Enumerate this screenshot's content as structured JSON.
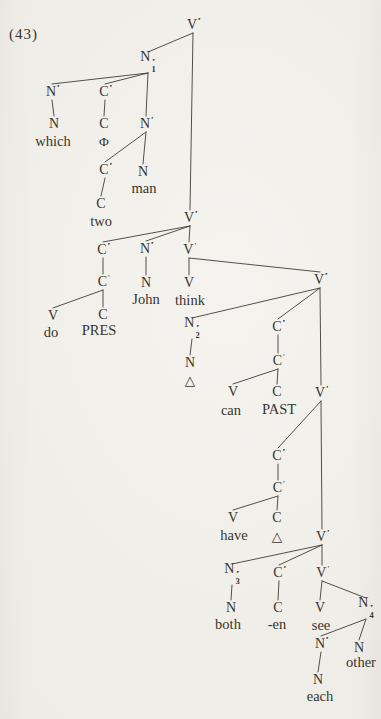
{
  "figure": {
    "label": "(43)"
  },
  "colors": {
    "background": "#f1efe9",
    "ink": "#38342d",
    "line": "#413d36"
  },
  "diagram": {
    "width": 381,
    "height": 719,
    "nodes": [
      {
        "id": "r",
        "base": "V",
        "primes": 3,
        "sub": "",
        "x": 193,
        "y": 25
      },
      {
        "id": "n1",
        "base": "N",
        "primes": 3,
        "sub": "1",
        "x": 148,
        "y": 62
      },
      {
        "id": "a1",
        "base": "N",
        "primes": 3,
        "sub": "",
        "x": 52,
        "y": 92
      },
      {
        "id": "a2",
        "base": "C",
        "primes": 3,
        "sub": "",
        "x": 105,
        "y": 92
      },
      {
        "id": "a3",
        "base": "N",
        "primes": 2,
        "sub": "",
        "x": 146,
        "y": 124
      },
      {
        "id": "a1n",
        "base": "N",
        "primes": 0,
        "sub": "",
        "x": 54,
        "y": 124
      },
      {
        "id": "a2c",
        "base": "C",
        "primes": 0,
        "sub": "",
        "x": 104,
        "y": 124
      },
      {
        "id": "b1",
        "base": "C",
        "primes": 3,
        "sub": "",
        "x": 105,
        "y": 170
      },
      {
        "id": "a3n",
        "base": "N",
        "primes": 0,
        "sub": "",
        "x": 143,
        "y": 172
      },
      {
        "id": "b1c",
        "base": "C",
        "primes": 0,
        "sub": "",
        "x": 101,
        "y": 204
      },
      {
        "id": "v2",
        "base": "V",
        "primes": 3,
        "sub": "",
        "x": 190,
        "y": 218
      },
      {
        "id": "c1",
        "base": "C",
        "primes": 3,
        "sub": "",
        "x": 103,
        "y": 250
      },
      {
        "id": "c2",
        "base": "N",
        "primes": 3,
        "sub": "",
        "x": 146,
        "y": 249
      },
      {
        "id": "c3",
        "base": "V",
        "primes": 1,
        "sub": "",
        "x": 189,
        "y": 250
      },
      {
        "id": "c1p",
        "base": "C",
        "primes": 1,
        "sub": "",
        "x": 103,
        "y": 282
      },
      {
        "id": "c1v",
        "base": "V",
        "primes": 0,
        "sub": "",
        "x": 53,
        "y": 316
      },
      {
        "id": "c1c",
        "base": "C",
        "primes": 0,
        "sub": "",
        "x": 103,
        "y": 315
      },
      {
        "id": "c2n",
        "base": "N",
        "primes": 0,
        "sub": "",
        "x": 146,
        "y": 283
      },
      {
        "id": "c3v",
        "base": "V",
        "primes": 0,
        "sub": "",
        "x": 189,
        "y": 283
      },
      {
        "id": "v3",
        "base": "V",
        "primes": 3,
        "sub": "",
        "x": 320,
        "y": 280
      },
      {
        "id": "d1",
        "base": "N",
        "primes": 3,
        "sub": "2",
        "x": 192,
        "y": 328
      },
      {
        "id": "d2",
        "base": "C",
        "primes": 3,
        "sub": "",
        "x": 278,
        "y": 327
      },
      {
        "id": "d1n",
        "base": "N",
        "primes": 0,
        "sub": "",
        "x": 190,
        "y": 363
      },
      {
        "id": "d2p",
        "base": "C",
        "primes": 1,
        "sub": "",
        "x": 278,
        "y": 361
      },
      {
        "id": "d2v",
        "base": "V",
        "primes": 0,
        "sub": "",
        "x": 233,
        "y": 392
      },
      {
        "id": "d2c",
        "base": "C",
        "primes": 0,
        "sub": "",
        "x": 277,
        "y": 392
      },
      {
        "id": "v4",
        "base": "V",
        "primes": 2,
        "sub": "",
        "x": 321,
        "y": 393
      },
      {
        "id": "e1",
        "base": "C",
        "primes": 3,
        "sub": "",
        "x": 278,
        "y": 456
      },
      {
        "id": "e1p",
        "base": "C",
        "primes": 1,
        "sub": "",
        "x": 278,
        "y": 488
      },
      {
        "id": "e1v",
        "base": "V",
        "primes": 0,
        "sub": "",
        "x": 233,
        "y": 518
      },
      {
        "id": "e1c",
        "base": "C",
        "primes": 0,
        "sub": "",
        "x": 277,
        "y": 518
      },
      {
        "id": "v5",
        "base": "V",
        "primes": 2,
        "sub": "",
        "x": 322,
        "y": 537
      },
      {
        "id": "f1",
        "base": "N",
        "primes": 3,
        "sub": "3",
        "x": 232,
        "y": 574
      },
      {
        "id": "f2",
        "base": "C",
        "primes": 3,
        "sub": "",
        "x": 279,
        "y": 573
      },
      {
        "id": "f3",
        "base": "V",
        "primes": 1,
        "sub": "",
        "x": 322,
        "y": 573
      },
      {
        "id": "f1n",
        "base": "N",
        "primes": 0,
        "sub": "",
        "x": 231,
        "y": 608
      },
      {
        "id": "f2c",
        "base": "C",
        "primes": 0,
        "sub": "",
        "x": 278,
        "y": 608
      },
      {
        "id": "f3v",
        "base": "V",
        "primes": 0,
        "sub": "",
        "x": 320,
        "y": 608
      },
      {
        "id": "g1",
        "base": "N",
        "primes": 3,
        "sub": "4",
        "x": 366,
        "y": 608
      },
      {
        "id": "g2",
        "base": "N",
        "primes": 3,
        "sub": "",
        "x": 321,
        "y": 644
      },
      {
        "id": "g3",
        "base": "N",
        "primes": 0,
        "sub": "",
        "x": 359,
        "y": 648
      },
      {
        "id": "g2n",
        "base": "N",
        "primes": 0,
        "sub": "",
        "x": 318,
        "y": 680
      }
    ],
    "terminals": [
      {
        "id": "which",
        "text": "which",
        "x": 53,
        "y": 141,
        "sym": false
      },
      {
        "id": "phi",
        "text": "Φ",
        "x": 104,
        "y": 142,
        "sym": true
      },
      {
        "id": "man",
        "text": "man",
        "x": 144,
        "y": 188,
        "sym": false
      },
      {
        "id": "two",
        "text": "two",
        "x": 101,
        "y": 221,
        "sym": false
      },
      {
        "id": "do",
        "text": "do",
        "x": 51,
        "y": 332,
        "sym": false
      },
      {
        "id": "pres",
        "text": "PRES",
        "x": 99,
        "y": 330,
        "sym": false
      },
      {
        "id": "john",
        "text": "John",
        "x": 146,
        "y": 299,
        "sym": false
      },
      {
        "id": "think",
        "text": "think",
        "x": 190,
        "y": 300,
        "sym": false
      },
      {
        "id": "delta1",
        "text": "△",
        "x": 190,
        "y": 381,
        "sym": true
      },
      {
        "id": "can",
        "text": "can",
        "x": 231,
        "y": 410,
        "sym": false
      },
      {
        "id": "past",
        "text": "PAST",
        "x": 279,
        "y": 409,
        "sym": false
      },
      {
        "id": "have",
        "text": "have",
        "x": 234,
        "y": 535,
        "sym": false
      },
      {
        "id": "delta2",
        "text": "△",
        "x": 277,
        "y": 537,
        "sym": true
      },
      {
        "id": "both",
        "text": "both",
        "x": 228,
        "y": 624,
        "sym": false
      },
      {
        "id": "en",
        "text": "-en",
        "x": 277,
        "y": 624,
        "sym": false
      },
      {
        "id": "see",
        "text": "see",
        "x": 321,
        "y": 625,
        "sym": false
      },
      {
        "id": "other",
        "text": "other",
        "x": 361,
        "y": 662,
        "sym": false
      },
      {
        "id": "each",
        "text": "each",
        "x": 320,
        "y": 696,
        "sym": false
      }
    ],
    "edges": [
      [
        "r",
        "n1"
      ],
      [
        "r",
        "v2"
      ],
      [
        "n1",
        "a1"
      ],
      [
        "n1",
        "a2"
      ],
      [
        "n1",
        "a3"
      ],
      [
        "a1",
        "a1n"
      ],
      [
        "a2",
        "a2c"
      ],
      [
        "a3",
        "b1"
      ],
      [
        "a3",
        "a3n"
      ],
      [
        "b1",
        "b1c"
      ],
      [
        "v2",
        "c1"
      ],
      [
        "v2",
        "c2"
      ],
      [
        "v2",
        "c3"
      ],
      [
        "c1",
        "c1p"
      ],
      [
        "c1p",
        "c1v"
      ],
      [
        "c1p",
        "c1c"
      ],
      [
        "c2",
        "c2n"
      ],
      [
        "c3",
        "c3v"
      ],
      [
        "c3",
        "v3"
      ],
      [
        "v3",
        "d1"
      ],
      [
        "v3",
        "d2"
      ],
      [
        "v3",
        "v4"
      ],
      [
        "d1",
        "d1n"
      ],
      [
        "d2",
        "d2p"
      ],
      [
        "d2p",
        "d2v"
      ],
      [
        "d2p",
        "d2c"
      ],
      [
        "v4",
        "e1"
      ],
      [
        "v4",
        "v5"
      ],
      [
        "e1",
        "e1p"
      ],
      [
        "e1p",
        "e1v"
      ],
      [
        "e1p",
        "e1c"
      ],
      [
        "v5",
        "f1"
      ],
      [
        "v5",
        "f2"
      ],
      [
        "v5",
        "f3"
      ],
      [
        "f1",
        "f1n"
      ],
      [
        "f2",
        "f2c"
      ],
      [
        "f3",
        "f3v"
      ],
      [
        "f3",
        "g1"
      ],
      [
        "g1",
        "g2"
      ],
      [
        "g1",
        "g3"
      ],
      [
        "g2",
        "g2n"
      ]
    ]
  }
}
